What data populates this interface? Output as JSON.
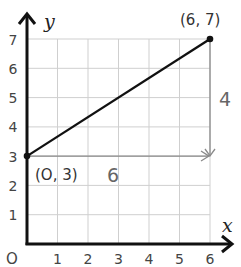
{
  "diagram": {
    "axes": {
      "x_label": "x",
      "y_label": "y",
      "origin_label": "O",
      "x_ticks": [
        "1",
        "2",
        "3",
        "4",
        "5",
        "6"
      ],
      "y_ticks": [
        "1",
        "2",
        "3",
        "4",
        "5",
        "6",
        "7"
      ]
    },
    "line": {
      "start": {
        "x": 0,
        "y": 3,
        "label": "(O, 3)"
      },
      "end": {
        "x": 6,
        "y": 7,
        "label": "(6, 7)"
      }
    },
    "run_label": "6",
    "rise_label": "4",
    "colors": {
      "grid": "#cccccc",
      "axis": "#111111",
      "line": "#111111",
      "arrows": "#888888"
    }
  }
}
